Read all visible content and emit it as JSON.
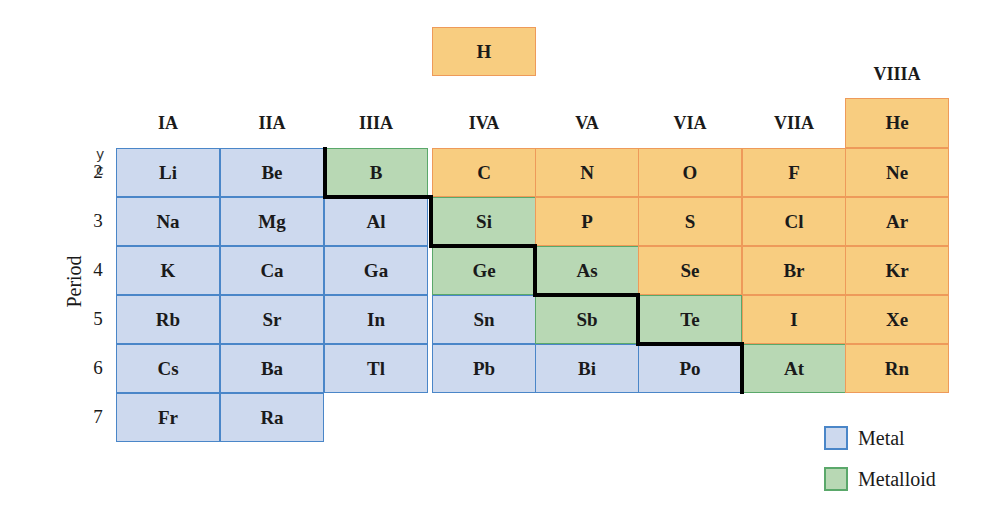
{
  "margin_fragment": {
    "line1": "y",
    "line2": "c"
  },
  "axis": {
    "period_label": "Period",
    "periods": [
      "2",
      "3",
      "4",
      "5",
      "6",
      "7"
    ]
  },
  "groups": [
    "IA",
    "IIA",
    "IIIA",
    "IVA",
    "VA",
    "VIA",
    "VIIA",
    "VIIIA"
  ],
  "hydrogen": {
    "symbol": "H",
    "category": "nonmetal"
  },
  "helium": {
    "symbol": "He",
    "category": "nonmetal"
  },
  "rows": [
    {
      "period": "2",
      "cells": [
        {
          "s": "Li",
          "c": "metal"
        },
        {
          "s": "Be",
          "c": "metal"
        },
        {
          "s": "B",
          "c": "metalloid"
        },
        {
          "s": "C",
          "c": "nonmetal"
        },
        {
          "s": "N",
          "c": "nonmetal"
        },
        {
          "s": "O",
          "c": "nonmetal"
        },
        {
          "s": "F",
          "c": "nonmetal"
        },
        {
          "s": "Ne",
          "c": "nonmetal"
        }
      ]
    },
    {
      "period": "3",
      "cells": [
        {
          "s": "Na",
          "c": "metal"
        },
        {
          "s": "Mg",
          "c": "metal"
        },
        {
          "s": "Al",
          "c": "metal"
        },
        {
          "s": "Si",
          "c": "metalloid"
        },
        {
          "s": "P",
          "c": "nonmetal"
        },
        {
          "s": "S",
          "c": "nonmetal"
        },
        {
          "s": "Cl",
          "c": "nonmetal"
        },
        {
          "s": "Ar",
          "c": "nonmetal"
        }
      ]
    },
    {
      "period": "4",
      "cells": [
        {
          "s": "K",
          "c": "metal"
        },
        {
          "s": "Ca",
          "c": "metal"
        },
        {
          "s": "Ga",
          "c": "metal"
        },
        {
          "s": "Ge",
          "c": "metalloid"
        },
        {
          "s": "As",
          "c": "metalloid"
        },
        {
          "s": "Se",
          "c": "nonmetal"
        },
        {
          "s": "Br",
          "c": "nonmetal"
        },
        {
          "s": "Kr",
          "c": "nonmetal"
        }
      ]
    },
    {
      "period": "5",
      "cells": [
        {
          "s": "Rb",
          "c": "metal"
        },
        {
          "s": "Sr",
          "c": "metal"
        },
        {
          "s": "In",
          "c": "metal"
        },
        {
          "s": "Sn",
          "c": "metal"
        },
        {
          "s": "Sb",
          "c": "metalloid"
        },
        {
          "s": "Te",
          "c": "metalloid"
        },
        {
          "s": "I",
          "c": "nonmetal"
        },
        {
          "s": "Xe",
          "c": "nonmetal"
        }
      ]
    },
    {
      "period": "6",
      "cells": [
        {
          "s": "Cs",
          "c": "metal"
        },
        {
          "s": "Ba",
          "c": "metal"
        },
        {
          "s": "Tl",
          "c": "metal"
        },
        {
          "s": "Pb",
          "c": "metal"
        },
        {
          "s": "Bi",
          "c": "metal"
        },
        {
          "s": "Po",
          "c": "metal"
        },
        {
          "s": "At",
          "c": "metalloid"
        },
        {
          "s": "Rn",
          "c": "nonmetal"
        }
      ]
    },
    {
      "period": "7",
      "cells": [
        {
          "s": "Fr",
          "c": "metal"
        },
        {
          "s": "Ra",
          "c": "metal"
        }
      ]
    }
  ],
  "legend": [
    {
      "label": "Metal",
      "color": "#cdd9ee",
      "border": "#4a86c8"
    },
    {
      "label": "Metalloid",
      "color": "#b8d8b4",
      "border": "#5aa86a"
    }
  ],
  "colors": {
    "metal": "#cdd9ee",
    "metalloid": "#b8d8b4",
    "nonmetal": "#f8cd80",
    "staircase": "#000000"
  }
}
